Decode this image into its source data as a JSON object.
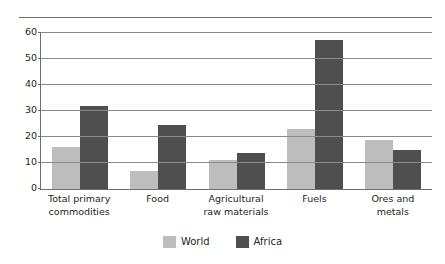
{
  "chart_data": {
    "type": "bar",
    "title": "",
    "subtitle": "",
    "xlabel": "",
    "ylabel": "",
    "ylim": [
      0,
      60
    ],
    "yticks": [
      0,
      10,
      20,
      30,
      40,
      50,
      60
    ],
    "grid": true,
    "legend_position": "bottom-center",
    "categories": [
      "Total primary commodities",
      "Food",
      "Agricultural raw materials",
      "Fuels",
      "Ores and metals"
    ],
    "category_lines": [
      [
        "Total primary",
        "commodities"
      ],
      [
        "Food",
        ""
      ],
      [
        "Agricultural",
        "raw materials"
      ],
      [
        "Fuels",
        ""
      ],
      [
        "Ores and",
        "metals"
      ]
    ],
    "series": [
      {
        "name": "World",
        "color": "#bdbdbd",
        "values": [
          16,
          7,
          11,
          23,
          19
        ]
      },
      {
        "name": "Africa",
        "color": "#4f4f4f",
        "values": [
          32,
          24.5,
          14,
          57.5,
          15
        ]
      }
    ]
  },
  "legend": {
    "items": [
      {
        "label": "World",
        "swatch": "world-swatch"
      },
      {
        "label": "Africa",
        "swatch": "africa-swatch"
      }
    ]
  }
}
